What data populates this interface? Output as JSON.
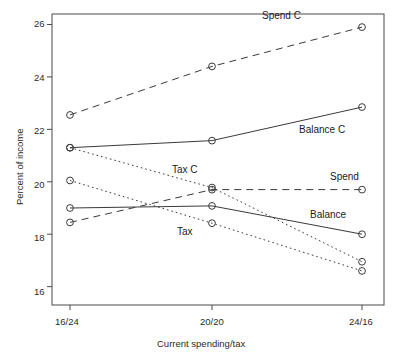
{
  "chart_data": {
    "type": "line",
    "title": "",
    "xlabel": "Current spending/tax",
    "ylabel": "Percent of income",
    "categories": [
      "16/24",
      "20/20",
      "24/16"
    ],
    "x": [
      0,
      1,
      2
    ],
    "ylim": [
      15.3,
      26.4
    ],
    "yticks": [
      16,
      18,
      20,
      22,
      24,
      26
    ],
    "ytick_labels": [
      "16",
      "18",
      "20",
      "22",
      "24",
      "26"
    ],
    "grid": false,
    "legend": "inline-annotations",
    "marker": "open-circle",
    "series": [
      {
        "name": "Spend C",
        "values": [
          22.55,
          24.4,
          25.9
        ],
        "style": "dashed",
        "label_x": 1.63,
        "label_y": 26.3
      },
      {
        "name": "Balance C",
        "values": [
          21.3,
          21.57,
          22.85
        ],
        "style": "solid",
        "label_x": 1.44,
        "label_y": 22.05
      },
      {
        "name": "Tax C",
        "values": [
          21.3,
          19.78,
          16.95
        ],
        "style": "dotted",
        "label_x": 0.7,
        "label_y": 20.55
      },
      {
        "name": "Spend",
        "values": [
          18.45,
          19.7,
          19.7
        ],
        "style": "dashed",
        "label_x": 1.72,
        "label_y": 20.25
      },
      {
        "name": "Balance",
        "values": [
          19.0,
          19.08,
          18.0
        ],
        "style": "solid",
        "label_x": 1.57,
        "label_y": 18.85
      },
      {
        "name": "Tax",
        "values": [
          20.05,
          18.42,
          16.6
        ],
        "style": "dotted",
        "label_x": 0.74,
        "label_y": 18.4
      }
    ]
  },
  "axes": {
    "x_tick_labels": [
      "16/24",
      "20/20",
      "24/16"
    ],
    "y_tick_labels": [
      "26",
      "24",
      "22",
      "20",
      "18",
      "16"
    ],
    "x_axis_title": "Current spending/tax",
    "y_axis_title": "Percent of income"
  }
}
